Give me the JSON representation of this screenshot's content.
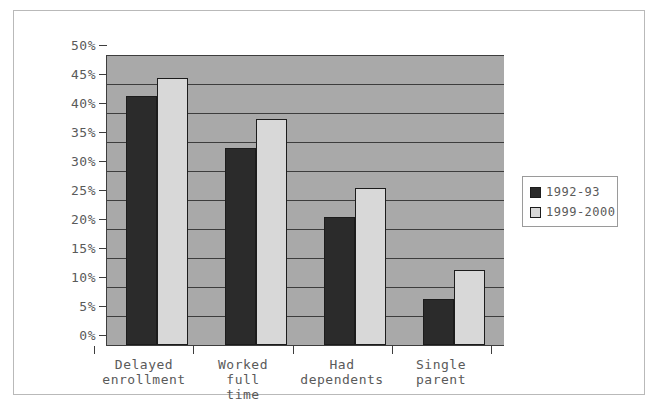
{
  "chart_data": {
    "type": "bar",
    "title": "",
    "xlabel": "",
    "ylabel": "",
    "ylim": [
      0,
      50
    ],
    "ytick_labels": [
      "50%",
      "45%",
      "40%",
      "35%",
      "30%",
      "25%",
      "20%",
      "15%",
      "10%",
      "5%",
      "0%"
    ],
    "ytick_values": [
      50,
      45,
      40,
      35,
      30,
      25,
      20,
      15,
      10,
      5,
      0
    ],
    "grid": true,
    "legend_position": "right",
    "categories": [
      "Delayed\nenrollment",
      "Worked\nfull\ntime",
      "Had\ndependents",
      "Single\nparent"
    ],
    "series": [
      {
        "name": "1992-93",
        "color": "#2b2b2b",
        "values": [
          43,
          34,
          22,
          8
        ]
      },
      {
        "name": "1999-2000",
        "color": "#d8d8d8",
        "values": [
          46,
          39,
          27,
          13
        ]
      }
    ],
    "colors": {
      "plot_background": "#a9a9a9",
      "gridline": "#3d3d3d",
      "axis": "#3d3d3d",
      "text": "#5a5a5a",
      "frame": "#b9b9b9",
      "page_background": "#ffffff"
    }
  }
}
